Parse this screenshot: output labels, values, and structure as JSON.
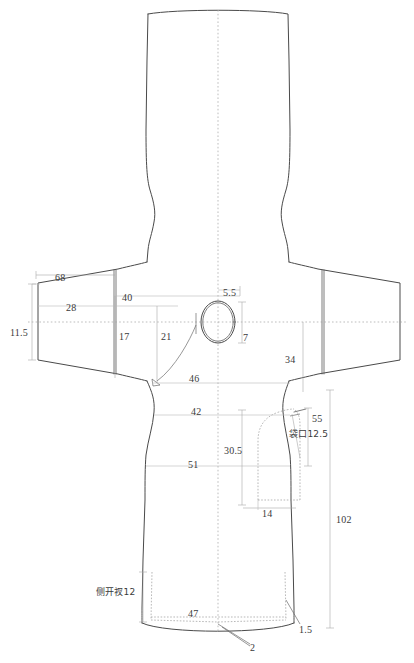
{
  "document": {
    "type": "garment-technical-flat-pattern",
    "title": "",
    "units": "cm",
    "line_color": "#555555",
    "dash_color": "#9a9a9a",
    "text_color": "#3a3a3a",
    "background": "#ffffff"
  },
  "dimensions": [
    {
      "id": "sleeve-hem-width",
      "value": "11.5",
      "x": 10,
      "y": 328,
      "align": "left"
    },
    {
      "id": "sleeve-top-length",
      "value": "68",
      "x": 55,
      "y": 273,
      "align": "left"
    },
    {
      "id": "sleeve-upper-width",
      "value": "28",
      "x": 66,
      "y": 303,
      "align": "left"
    },
    {
      "id": "shoulder-to-center",
      "value": "40",
      "x": 122,
      "y": 293,
      "align": "left"
    },
    {
      "id": "armhole-depth",
      "value": "17",
      "x": 119,
      "y": 332,
      "align": "left"
    },
    {
      "id": "half-chest-front",
      "value": "21",
      "x": 161,
      "y": 332,
      "align": "left"
    },
    {
      "id": "neck-front-drop",
      "value": "5.5",
      "x": 223,
      "y": 288,
      "align": "left"
    },
    {
      "id": "neck-width",
      "value": "7",
      "x": 243,
      "y": 333,
      "align": "left"
    },
    {
      "id": "sleeve-cap-height",
      "value": "34",
      "x": 285,
      "y": 355,
      "align": "left"
    },
    {
      "id": "chest-line",
      "value": "46",
      "x": 189,
      "y": 374,
      "align": "left"
    },
    {
      "id": "waist-line",
      "value": "42",
      "x": 191,
      "y": 407,
      "align": "left"
    },
    {
      "id": "pocket-depth",
      "value": "30.5",
      "x": 224,
      "y": 446,
      "align": "left"
    },
    {
      "id": "hip-line",
      "value": "51",
      "x": 188,
      "y": 460,
      "align": "left"
    },
    {
      "id": "pocket-width",
      "value": "14",
      "x": 262,
      "y": 509,
      "align": "left"
    },
    {
      "id": "pocket-position",
      "value": "55",
      "x": 312,
      "y": 414,
      "align": "left"
    },
    {
      "id": "pocket-opening",
      "value": "袋口12.5",
      "x": 289,
      "y": 430,
      "align": "left",
      "cn": true
    },
    {
      "id": "total-length",
      "value": "102",
      "x": 336,
      "y": 515,
      "align": "left"
    },
    {
      "id": "side-slit",
      "value": "侧开衩12",
      "x": 96,
      "y": 588,
      "align": "left",
      "cn": true
    },
    {
      "id": "hem-width",
      "value": "47",
      "x": 188,
      "y": 609,
      "align": "left"
    },
    {
      "id": "hem-facing",
      "value": "2",
      "x": 250,
      "y": 643,
      "align": "left"
    },
    {
      "id": "slit-facing",
      "value": "1.5",
      "x": 299,
      "y": 625,
      "align": "left"
    }
  ],
  "geometry": {
    "center_line_x": 218,
    "bust_line_y": 322,
    "sleeve_left_tip_x": 38,
    "sleeve_right_tip_x": 400,
    "hem_y": 628,
    "neck_oval": {
      "cx": 218,
      "cy": 322,
      "rx": 17,
      "ry": 21
    }
  }
}
